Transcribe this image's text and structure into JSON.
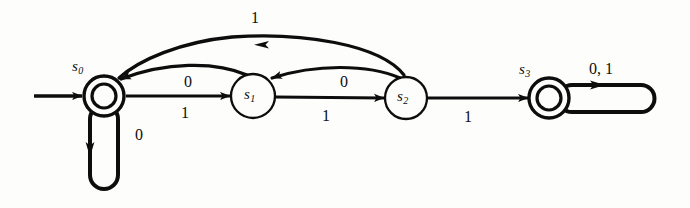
{
  "diagram": {
    "kind": "finite-state-machine",
    "title": "",
    "ink_color": "#0d0d0d",
    "background_color": "#fdfdfc",
    "states": [
      {
        "id": "s0",
        "name": "s",
        "subscript": "0",
        "accepting": true,
        "start": true,
        "cx": 104,
        "cy": 96,
        "r_outer": 20,
        "r_inner": 12,
        "label_x": 72,
        "label_y": 58
      },
      {
        "id": "s1",
        "name": "s",
        "subscript": "1",
        "accepting": false,
        "start": false,
        "cx": 253,
        "cy": 96,
        "r_outer": 22,
        "r_inner": 0,
        "label_x": 244,
        "label_y": 86
      },
      {
        "id": "s2",
        "name": "s",
        "subscript": "2",
        "accepting": false,
        "start": false,
        "cx": 406,
        "cy": 98,
        "r_outer": 21,
        "r_inner": 0,
        "label_x": 397,
        "label_y": 88
      },
      {
        "id": "s3",
        "name": "s",
        "subscript": "3",
        "accepting": true,
        "start": false,
        "cx": 549,
        "cy": 98,
        "r_outer": 20,
        "r_inner": 12,
        "label_x": 519,
        "label_y": 61
      }
    ],
    "transitions": [
      {
        "id": "start-arrow",
        "from": "",
        "to": "s0",
        "label": "",
        "shape": "straight-in"
      },
      {
        "id": "s0-s1",
        "from": "s0",
        "to": "s1",
        "label": "1",
        "label_x": 181,
        "label_y": 104,
        "shape": "straight"
      },
      {
        "id": "s1-s2",
        "from": "s1",
        "to": "s2",
        "label": "1",
        "label_x": 322,
        "label_y": 107,
        "shape": "straight"
      },
      {
        "id": "s2-s3",
        "from": "s2",
        "to": "s3",
        "label": "1",
        "label_x": 464,
        "label_y": 108,
        "shape": "straight"
      },
      {
        "id": "s1-s0",
        "from": "s1",
        "to": "s0",
        "label": "0",
        "label_x": 184,
        "label_y": 73,
        "shape": "arc-back"
      },
      {
        "id": "s2-s1",
        "from": "s2",
        "to": "s1",
        "label": "0",
        "label_x": 340,
        "label_y": 73,
        "shape": "arc-back"
      },
      {
        "id": "s2-s0",
        "from": "s2",
        "to": "s0",
        "label": "1",
        "label_x": 251,
        "label_y": 9,
        "shape": "arc-back-outer"
      },
      {
        "id": "s0-s0",
        "from": "s0",
        "to": "s0",
        "label": "0",
        "label_x": 135,
        "label_y": 126,
        "shape": "self-loop-down"
      },
      {
        "id": "s3-s3",
        "from": "s3",
        "to": "s3",
        "label": "0, 1",
        "label_x": 589,
        "label_y": 60,
        "shape": "self-loop-right"
      }
    ]
  }
}
